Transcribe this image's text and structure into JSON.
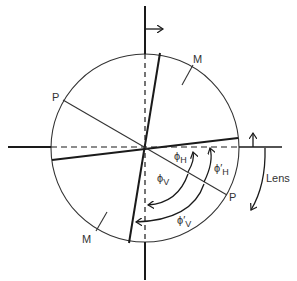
{
  "diagram": {
    "labels": {
      "P_top": "P",
      "P_bottom": "P",
      "M_top": "M",
      "M_bottom": "M",
      "phi_H": "ϕ",
      "phi_H_sub": "H",
      "phi_H_prime": "ϕ′",
      "phi_H_prime_sub": "H",
      "phi_V": "ϕ",
      "phi_V_sub": "V",
      "phi_V_prime": "ϕ′",
      "phi_V_prime_sub": "V",
      "lens": "Lens"
    },
    "colors": {
      "line": "#1a1a1a",
      "thin": "#333333",
      "background": "#ffffff"
    }
  }
}
